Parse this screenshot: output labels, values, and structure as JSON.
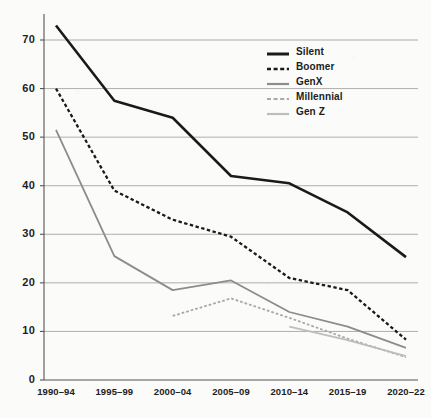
{
  "chart_data": {
    "type": "line",
    "title": "",
    "subtitle": "",
    "xlabel": "",
    "ylabel": "",
    "xlim": [
      0,
      6
    ],
    "ylim": [
      0,
      75
    ],
    "yticks": [
      0,
      10,
      20,
      30,
      40,
      50,
      60,
      70
    ],
    "grid": true,
    "grid_axis": "y",
    "legend_position": "upper right",
    "categories": [
      "1990–94",
      "1995–99",
      "2000–04",
      "2005–09",
      "2010–14",
      "2015–19",
      "2020–22"
    ],
    "series": [
      {
        "name": "Silent",
        "color": "#1a1a1a",
        "style": "solid",
        "width": 2.6,
        "values": [
          73,
          57.5,
          54,
          42,
          40.5,
          34.5,
          25.3
        ]
      },
      {
        "name": "Boomer",
        "color": "#1a1a1a",
        "style": "dashed",
        "width": 2.3,
        "values": [
          60,
          39,
          33,
          29.5,
          21,
          18.5,
          8.3
        ]
      },
      {
        "name": "GenX",
        "color": "#8c8c8c",
        "style": "solid",
        "width": 1.8,
        "values": [
          51.5,
          25.5,
          18.5,
          20.5,
          14,
          11,
          6.6
        ]
      },
      {
        "name": "Millennial",
        "color": "#a8a8a8",
        "style": "dashed",
        "width": 1.8,
        "values": [
          null,
          null,
          13.2,
          16.8,
          12.8,
          8.5,
          4.7
        ]
      },
      {
        "name": "Gen Z",
        "color": "#bdbdbd",
        "style": "solid",
        "width": 1.8,
        "values": [
          null,
          null,
          null,
          null,
          11,
          8.2,
          4.9
        ]
      }
    ]
  },
  "axes": {
    "y_tick_labels": [
      "70",
      "60",
      "50",
      "40",
      "30",
      "20",
      "10",
      "0"
    ],
    "x_tick_labels": [
      "1990–94",
      "1995–99",
      "2000–04",
      "2005–09",
      "2010–14",
      "2015–19",
      "2020–22"
    ]
  },
  "legend": {
    "items": [
      {
        "label": "Silent"
      },
      {
        "label": "Boomer"
      },
      {
        "label": "GenX"
      },
      {
        "label": "Millennial"
      },
      {
        "label": "Gen Z"
      }
    ]
  },
  "colors": {
    "background": "#fbfbf9",
    "axis": "#555555",
    "grid": "#9a9a9a",
    "text": "#1d1d1d"
  }
}
